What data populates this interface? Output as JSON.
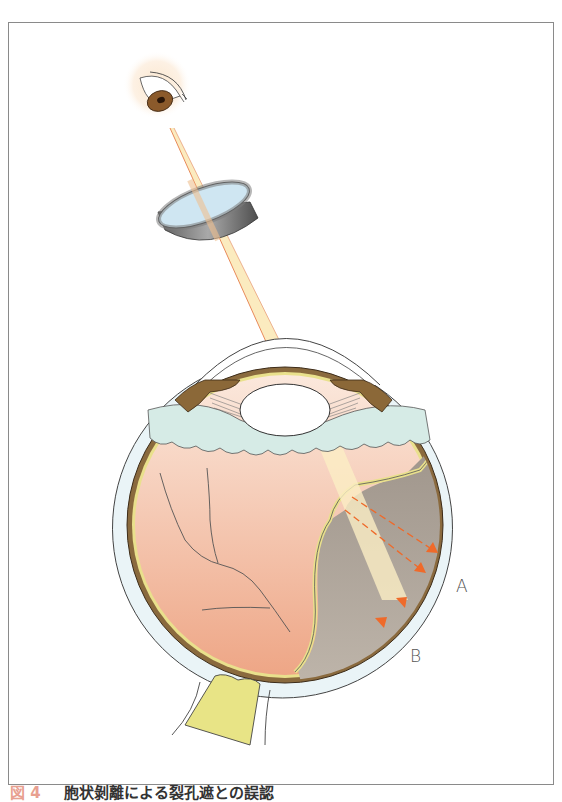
{
  "figure": {
    "caption_number": "図 4",
    "caption_text": "胞状剝離による裂孔遮との誤認",
    "labels": {
      "a": "A",
      "b": "B"
    },
    "colors": {
      "frame": "#8a8a8a",
      "light_beam": "#fbe9b8",
      "beam_edge": "#e88a5a",
      "arrow": "#ef6a2a",
      "retina_attached": "#f3c2a8",
      "detached_area": "#b2a79c",
      "choroid": "#8a6a3e",
      "sclera": "#e9f3f6",
      "vitreous_base": "#d6ebe6",
      "optic_nerve": "#e8e486",
      "iris": "#8b5a2b",
      "lens_ring": "#6f6f6f",
      "lens_glass": "#cfe6f2"
    },
    "elements": [
      "observer-eye",
      "contact-lens",
      "light-beam",
      "eyeball-cross-section",
      "detached-retina",
      "optic-nerve",
      "reflected-arrows"
    ]
  }
}
